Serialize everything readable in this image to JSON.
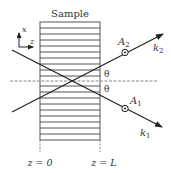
{
  "figure": {
    "sample_label": "Sample",
    "axes": {
      "x_label": "x",
      "z_label": "z"
    },
    "angle_label_upper": "θ",
    "angle_label_lower": "θ",
    "beams": [
      {
        "name": "k1",
        "label_base": "k",
        "label_sub": "1",
        "amp_base": "A",
        "amp_sub": "1"
      },
      {
        "name": "k2",
        "label_base": "k",
        "label_sub": "2",
        "amp_base": "A",
        "amp_sub": "2"
      }
    ],
    "boundaries": [
      {
        "label": "z = 0"
      },
      {
        "label": "z = L"
      }
    ],
    "colors": {
      "line": "#222222",
      "stripe": "#555555",
      "dashed": "#888888"
    }
  }
}
